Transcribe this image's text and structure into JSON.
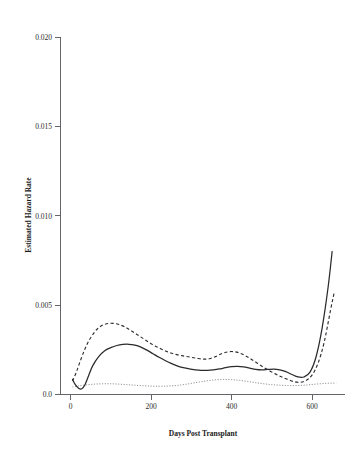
{
  "chart_data": {
    "type": "line",
    "title": "",
    "xlabel": "Days Post Transplant",
    "ylabel": "Estimated Hazard Rate",
    "xlim": [
      0,
      700
    ],
    "ylim": [
      0.0,
      0.02
    ],
    "xticks": [
      0,
      200,
      400,
      600
    ],
    "xtick_labels": [
      "0",
      "200",
      "400",
      "600"
    ],
    "yticks": [
      0.0,
      0.005,
      0.01,
      0.015,
      0.02
    ],
    "ytick_labels": [
      "0.0",
      "0.005",
      "0.010",
      "0.015",
      "0.020"
    ],
    "grid": false,
    "legend": "none",
    "axes_style": "left-and-bottom-only",
    "series": [
      {
        "name": "solid-curve",
        "style": "solid",
        "color": "#2a2a2e",
        "x": [
          5,
          12,
          20,
          28,
          36,
          45,
          55,
          70,
          85,
          100,
          115,
          130,
          145,
          160,
          175,
          190,
          205,
          220,
          235,
          250,
          265,
          280,
          295,
          310,
          325,
          340,
          355,
          370,
          385,
          400,
          415,
          430,
          445,
          460,
          475,
          490,
          505,
          520,
          535,
          550,
          565,
          580,
          595,
          610,
          625,
          640,
          650
        ],
        "y": [
          0.00085,
          0.00055,
          0.00035,
          0.00032,
          0.00055,
          0.00105,
          0.0016,
          0.00212,
          0.00245,
          0.00262,
          0.00274,
          0.0028,
          0.00281,
          0.00276,
          0.00265,
          0.00248,
          0.00228,
          0.00208,
          0.0019,
          0.00174,
          0.0016,
          0.0015,
          0.00143,
          0.00138,
          0.00135,
          0.00135,
          0.00138,
          0.00143,
          0.0015,
          0.00156,
          0.00158,
          0.00155,
          0.00148,
          0.00141,
          0.00138,
          0.0014,
          0.00142,
          0.00138,
          0.00128,
          0.00112,
          0.00098,
          0.00098,
          0.00125,
          0.0021,
          0.0037,
          0.006,
          0.008
        ]
      },
      {
        "name": "dashed-curve",
        "style": "dashed",
        "color": "#2f2f33",
        "x": [
          5,
          15,
          25,
          35,
          45,
          60,
          75,
          90,
          105,
          120,
          135,
          150,
          165,
          180,
          195,
          210,
          225,
          240,
          255,
          270,
          285,
          300,
          315,
          330,
          345,
          360,
          375,
          390,
          405,
          420,
          435,
          450,
          465,
          480,
          495,
          510,
          525,
          540,
          555,
          570,
          585,
          600,
          615,
          630,
          645,
          655
        ],
        "y": [
          0.00075,
          0.00128,
          0.00192,
          0.0025,
          0.00298,
          0.0035,
          0.00382,
          0.00396,
          0.00398,
          0.00392,
          0.00378,
          0.00358,
          0.00336,
          0.00314,
          0.00292,
          0.00272,
          0.00255,
          0.0024,
          0.00228,
          0.0022,
          0.00214,
          0.00208,
          0.00202,
          0.00198,
          0.002,
          0.00212,
          0.00228,
          0.00238,
          0.0024,
          0.00232,
          0.00216,
          0.00196,
          0.00174,
          0.00152,
          0.00132,
          0.00114,
          0.00098,
          0.00084,
          0.00072,
          0.00068,
          0.00078,
          0.00108,
          0.00175,
          0.0029,
          0.0046,
          0.0057
        ]
      },
      {
        "name": "dotted-curve",
        "style": "dotted",
        "color": "#7d7d82",
        "x": [
          5,
          20,
          40,
          60,
          80,
          100,
          120,
          140,
          160,
          180,
          200,
          220,
          240,
          260,
          280,
          300,
          320,
          340,
          360,
          380,
          400,
          420,
          440,
          460,
          480,
          500,
          520,
          540,
          560,
          580,
          600,
          620,
          640,
          660
        ],
        "y": [
          0.00042,
          0.00048,
          0.00054,
          0.00058,
          0.0006,
          0.0006,
          0.00058,
          0.00055,
          0.00052,
          0.00049,
          0.00047,
          0.00046,
          0.00047,
          0.0005,
          0.00055,
          0.00062,
          0.0007,
          0.00077,
          0.00082,
          0.00084,
          0.00083,
          0.00079,
          0.00073,
          0.00066,
          0.0006,
          0.00055,
          0.00052,
          0.0005,
          0.0005,
          0.00052,
          0.00056,
          0.0006,
          0.00063,
          0.00064
        ]
      }
    ]
  },
  "axis": {
    "x_title": "Days Post Transplant",
    "y_title": "Estimated Hazard Rate"
  }
}
